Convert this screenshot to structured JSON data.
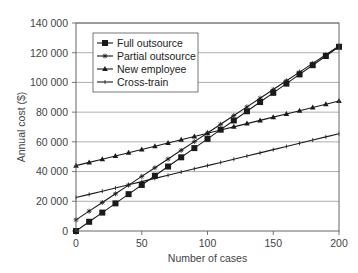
{
  "chart_data": {
    "type": "line",
    "title": "",
    "xlabel": "Number of cases",
    "ylabel": "Annual cost ($)",
    "xlim": [
      0,
      200
    ],
    "ylim": [
      0,
      140000
    ],
    "x_ticks": [
      0,
      50,
      100,
      150,
      200
    ],
    "x_tick_labels": [
      "0",
      "50",
      "100",
      "150",
      "200"
    ],
    "y_ticks": [
      0,
      20000,
      40000,
      60000,
      80000,
      100000,
      120000,
      140000
    ],
    "y_tick_labels": [
      "0",
      "20 000",
      "40 000",
      "60 000",
      "80 000",
      "100 000",
      "120 000",
      "140 000"
    ],
    "grid": "horizontal",
    "legend_position": "upper-left-inside",
    "x": [
      0,
      10,
      20,
      30,
      40,
      50,
      60,
      70,
      80,
      90,
      100,
      110,
      120,
      130,
      140,
      150,
      160,
      170,
      180,
      190,
      200
    ],
    "series": [
      {
        "name": "Full outsource",
        "marker": "square",
        "values": [
          0,
          6200,
          12400,
          18600,
          24800,
          31000,
          37200,
          43400,
          49600,
          55800,
          62000,
          68200,
          74400,
          80600,
          86800,
          93000,
          99200,
          105400,
          111600,
          117800,
          124000
        ]
      },
      {
        "name": "Partial outsource",
        "marker": "star",
        "values": [
          7500,
          13350,
          19200,
          25050,
          30900,
          36750,
          42600,
          48450,
          54300,
          60150,
          66000,
          71850,
          77700,
          83550,
          89400,
          95250,
          101100,
          106950,
          112800,
          118650,
          124500
        ]
      },
      {
        "name": "New employee",
        "marker": "triangle",
        "values": [
          44000,
          46175,
          48350,
          50525,
          52700,
          54875,
          57050,
          59225,
          61400,
          63575,
          65750,
          67925,
          70100,
          72275,
          74450,
          76625,
          78800,
          80975,
          83150,
          85325,
          87500
        ]
      },
      {
        "name": "Cross-train",
        "marker": "tick",
        "values": [
          22500,
          24650,
          26800,
          28950,
          31100,
          33250,
          35400,
          37550,
          39700,
          41850,
          44000,
          46150,
          48300,
          50450,
          52600,
          54750,
          56900,
          59050,
          61200,
          63350,
          65500
        ]
      }
    ]
  },
  "colors": {
    "line": "#1a1a1a",
    "grid": "#9a9a9a",
    "axis": "#555555",
    "legend_border": "#555555"
  }
}
